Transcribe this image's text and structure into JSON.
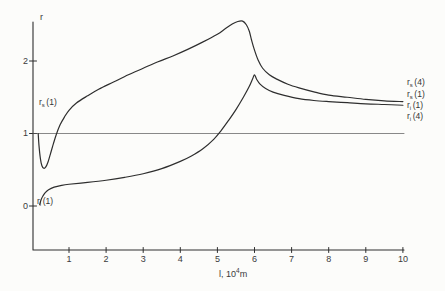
{
  "figure": {
    "background": "#fcfcfa",
    "axis_color": "#2e2e2e",
    "curve_color": "#2e2e2e",
    "ref_line_color": "#565656"
  },
  "chart_data": {
    "type": "line",
    "title": "",
    "ylabel": "r",
    "xlabel": {
      "prefix": "l, 10",
      "superscript": "4",
      "suffix": "m"
    },
    "xlim": [
      0,
      10
    ],
    "ylim": [
      -0.6,
      2.7
    ],
    "x_ticks": [
      "1",
      "2",
      "3",
      "4",
      "5",
      "6",
      "7",
      "8",
      "9",
      "10"
    ],
    "x_tick_values": [
      1,
      2,
      3,
      4,
      5,
      6,
      7,
      8,
      9,
      10
    ],
    "y_ticks": [
      "0",
      "1",
      "2"
    ],
    "y_tick_values": [
      0,
      1,
      2
    ],
    "grid": false,
    "legend_position": "right-edge-labels",
    "reference_line_y": 1,
    "series": [
      {
        "name": "rs-curve",
        "annotation": {
          "base": "r",
          "sub": "s",
          "arg": "(1)"
        },
        "points": [
          [
            0.17,
            1.0
          ],
          [
            0.19,
            0.84
          ],
          [
            0.23,
            0.65
          ],
          [
            0.27,
            0.555
          ],
          [
            0.32,
            0.52
          ],
          [
            0.37,
            0.535
          ],
          [
            0.43,
            0.6
          ],
          [
            0.5,
            0.72
          ],
          [
            0.58,
            0.86
          ],
          [
            0.66,
            0.99
          ],
          [
            0.76,
            1.12
          ],
          [
            0.88,
            1.23
          ],
          [
            1.0,
            1.32
          ],
          [
            1.2,
            1.42
          ],
          [
            1.5,
            1.52
          ],
          [
            1.8,
            1.61
          ],
          [
            2.2,
            1.71
          ],
          [
            2.6,
            1.81
          ],
          [
            3.0,
            1.9
          ],
          [
            3.4,
            1.99
          ],
          [
            3.8,
            2.07
          ],
          [
            4.2,
            2.16
          ],
          [
            4.6,
            2.26
          ],
          [
            5.0,
            2.37
          ],
          [
            5.2,
            2.44
          ],
          [
            5.4,
            2.51
          ],
          [
            5.55,
            2.545
          ],
          [
            5.68,
            2.55
          ],
          [
            5.78,
            2.5
          ],
          [
            5.86,
            2.41
          ],
          [
            5.92,
            2.29
          ],
          [
            6.0,
            2.15
          ],
          [
            6.1,
            2.01
          ],
          [
            6.22,
            1.9
          ],
          [
            6.4,
            1.81
          ],
          [
            6.6,
            1.75
          ],
          [
            6.9,
            1.68
          ],
          [
            7.2,
            1.63
          ],
          [
            7.6,
            1.575
          ],
          [
            8.0,
            1.53
          ],
          [
            8.5,
            1.5
          ],
          [
            9.0,
            1.47
          ],
          [
            9.5,
            1.45
          ],
          [
            10.0,
            1.44
          ]
        ]
      },
      {
        "name": "ri-curve",
        "annotation": {
          "base": "r",
          "sub": "i",
          "arg": "(1)"
        },
        "points": [
          [
            0.21,
            0.02
          ],
          [
            0.25,
            0.09
          ],
          [
            0.3,
            0.14
          ],
          [
            0.36,
            0.185
          ],
          [
            0.45,
            0.225
          ],
          [
            0.6,
            0.26
          ],
          [
            0.8,
            0.285
          ],
          [
            1.0,
            0.3
          ],
          [
            1.5,
            0.325
          ],
          [
            2.0,
            0.355
          ],
          [
            2.5,
            0.395
          ],
          [
            3.0,
            0.445
          ],
          [
            3.5,
            0.515
          ],
          [
            4.0,
            0.615
          ],
          [
            4.3,
            0.69
          ],
          [
            4.6,
            0.785
          ],
          [
            4.9,
            0.92
          ],
          [
            5.1,
            1.04
          ],
          [
            5.3,
            1.18
          ],
          [
            5.5,
            1.33
          ],
          [
            5.7,
            1.5
          ],
          [
            5.85,
            1.64
          ],
          [
            5.95,
            1.755
          ],
          [
            6.0,
            1.81
          ],
          [
            6.06,
            1.745
          ],
          [
            6.15,
            1.68
          ],
          [
            6.3,
            1.62
          ],
          [
            6.5,
            1.57
          ],
          [
            6.8,
            1.525
          ],
          [
            7.2,
            1.48
          ],
          [
            7.6,
            1.455
          ],
          [
            8.0,
            1.44
          ],
          [
            8.5,
            1.425
          ],
          [
            9.0,
            1.41
          ],
          [
            9.5,
            1.4
          ],
          [
            10.0,
            1.39
          ]
        ]
      }
    ],
    "right_labels": [
      {
        "base": "r",
        "sub": "s",
        "arg": "(4)"
      },
      {
        "base": "r",
        "sub": "s",
        "arg": "(1)"
      },
      {
        "base": "r",
        "sub": "i",
        "arg": "(1)"
      },
      {
        "base": "r",
        "sub": "i",
        "arg": "(4)"
      }
    ]
  }
}
